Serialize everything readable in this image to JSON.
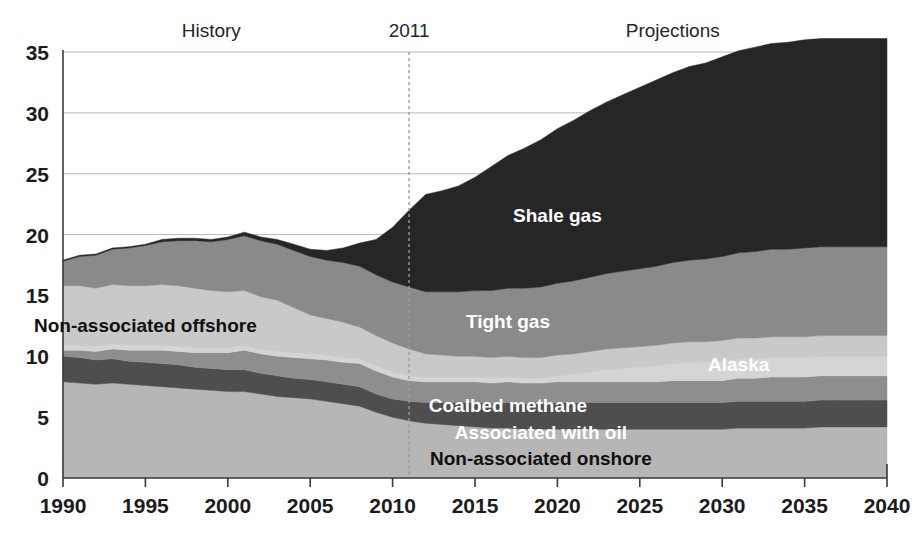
{
  "chart_data": {
    "type": "area",
    "stacked": true,
    "title": "",
    "subtitle": "",
    "xlabel": "",
    "ylabel": "",
    "xlim": [
      1990,
      2040
    ],
    "ylim": [
      0,
      35
    ],
    "ytick_labels": [
      "0",
      "5",
      "10",
      "15",
      "20",
      "25",
      "30",
      "35"
    ],
    "ytick_values": [
      0,
      5,
      10,
      15,
      20,
      25,
      30,
      35
    ],
    "xtick_labels": [
      "1990",
      "1995",
      "2000",
      "2005",
      "2010",
      "2015",
      "2020",
      "2025",
      "2030",
      "2035",
      "2040"
    ],
    "xtick_values": [
      1990,
      1995,
      2000,
      2005,
      2010,
      2015,
      2020,
      2025,
      2030,
      2035,
      2040
    ],
    "grid": true,
    "legend_position": "inline-annotations",
    "annotations": [
      {
        "name": "history-label",
        "text": "History",
        "x": 1999,
        "y": 36.2
      },
      {
        "name": "projection-divider-label",
        "text": "2011",
        "x": 2011,
        "y": 36.2
      },
      {
        "name": "projections-label",
        "text": "Projections",
        "x": 2027,
        "y": 36.2
      }
    ],
    "divider": {
      "x": 2011,
      "style": "dashed"
    },
    "x": [
      1990,
      1991,
      1992,
      1993,
      1994,
      1995,
      1996,
      1997,
      1998,
      1999,
      2000,
      2001,
      2002,
      2003,
      2004,
      2005,
      2006,
      2007,
      2008,
      2009,
      2010,
      2011,
      2012,
      2013,
      2014,
      2015,
      2016,
      2017,
      2018,
      2019,
      2020,
      2021,
      2022,
      2023,
      2024,
      2025,
      2026,
      2027,
      2028,
      2029,
      2030,
      2031,
      2032,
      2033,
      2034,
      2035,
      2036,
      2037,
      2038,
      2039,
      2040
    ],
    "series": [
      {
        "name": "Non-associated onshore",
        "color": "#b6b6b6",
        "label_x": 2019,
        "label_y": 1.1,
        "label_color": "dark",
        "values": [
          7.9,
          7.8,
          7.7,
          7.8,
          7.7,
          7.6,
          7.5,
          7.4,
          7.3,
          7.2,
          7.1,
          7.1,
          6.9,
          6.7,
          6.6,
          6.5,
          6.3,
          6.1,
          5.9,
          5.4,
          5.0,
          4.7,
          4.5,
          4.4,
          4.3,
          4.2,
          4.1,
          4.1,
          4.0,
          4.0,
          4.0,
          4.0,
          4.0,
          4.0,
          4.0,
          4.0,
          4.0,
          4.0,
          4.0,
          4.0,
          4.0,
          4.1,
          4.1,
          4.1,
          4.1,
          4.1,
          4.2,
          4.2,
          4.2,
          4.2,
          4.2
        ]
      },
      {
        "name": "Associated with oil",
        "color": "#4e4e4e",
        "label_x": 2019,
        "label_y": 3.2,
        "label_color": "light",
        "values": [
          2.1,
          2.1,
          2.0,
          2.0,
          1.9,
          1.9,
          1.9,
          1.9,
          1.8,
          1.8,
          1.8,
          1.8,
          1.7,
          1.7,
          1.6,
          1.6,
          1.6,
          1.6,
          1.6,
          1.5,
          1.5,
          1.6,
          1.7,
          1.8,
          1.9,
          2.0,
          2.0,
          2.1,
          2.1,
          2.1,
          2.2,
          2.2,
          2.2,
          2.2,
          2.2,
          2.2,
          2.2,
          2.2,
          2.2,
          2.2,
          2.2,
          2.2,
          2.2,
          2.2,
          2.2,
          2.2,
          2.2,
          2.2,
          2.2,
          2.2,
          2.2
        ]
      },
      {
        "name": "Coalbed methane",
        "color": "#8e8e8e",
        "label_x": 2017,
        "label_y": 5.4,
        "label_color": "light",
        "values": [
          0.5,
          0.6,
          0.7,
          0.8,
          0.9,
          1.0,
          1.1,
          1.1,
          1.2,
          1.3,
          1.4,
          1.6,
          1.6,
          1.6,
          1.7,
          1.7,
          1.8,
          1.8,
          1.9,
          1.9,
          1.8,
          1.7,
          1.7,
          1.7,
          1.7,
          1.7,
          1.7,
          1.7,
          1.7,
          1.7,
          1.7,
          1.7,
          1.7,
          1.7,
          1.7,
          1.7,
          1.7,
          1.8,
          1.8,
          1.8,
          1.8,
          1.9,
          1.9,
          2.0,
          2.0,
          2.0,
          2.0,
          2.0,
          2.0,
          2.0,
          2.0
        ]
      },
      {
        "name": "Alaska",
        "color": "#d5d5d5",
        "label_x": 2031,
        "label_y": 8.8,
        "label_color": "light",
        "values": [
          0.4,
          0.4,
          0.4,
          0.4,
          0.4,
          0.4,
          0.4,
          0.4,
          0.4,
          0.4,
          0.4,
          0.4,
          0.4,
          0.4,
          0.4,
          0.4,
          0.4,
          0.4,
          0.4,
          0.4,
          0.4,
          0.4,
          0.4,
          0.4,
          0.4,
          0.4,
          0.4,
          0.4,
          0.4,
          0.4,
          0.5,
          0.6,
          0.8,
          1.0,
          1.1,
          1.2,
          1.3,
          1.4,
          1.5,
          1.5,
          1.6,
          1.6,
          1.6,
          1.6,
          1.6,
          1.6,
          1.6,
          1.6,
          1.6,
          1.6,
          1.6
        ]
      },
      {
        "name": "Non-associated offshore",
        "color": "#c9c9c9",
        "label_x": 1995,
        "label_y": 12.0,
        "label_color": "dark",
        "values": [
          4.9,
          4.9,
          4.8,
          4.9,
          4.9,
          4.9,
          5.0,
          5.0,
          4.9,
          4.7,
          4.6,
          4.5,
          4.3,
          4.2,
          3.7,
          3.2,
          3.0,
          2.9,
          2.6,
          2.5,
          2.4,
          2.2,
          1.9,
          1.8,
          1.7,
          1.7,
          1.7,
          1.7,
          1.7,
          1.7,
          1.7,
          1.7,
          1.7,
          1.7,
          1.7,
          1.7,
          1.7,
          1.7,
          1.7,
          1.7,
          1.7,
          1.7,
          1.7,
          1.7,
          1.7,
          1.7,
          1.7,
          1.7,
          1.7,
          1.7,
          1.7
        ]
      },
      {
        "name": "Tight gas",
        "color": "#8a8a8a",
        "label_x": 2017,
        "label_y": 12.3,
        "label_color": "light",
        "values": [
          2.0,
          2.4,
          2.7,
          2.9,
          3.1,
          3.3,
          3.5,
          3.7,
          3.9,
          4.0,
          4.3,
          4.5,
          4.6,
          4.6,
          4.7,
          4.8,
          4.8,
          4.9,
          5.0,
          5.0,
          5.0,
          5.1,
          5.1,
          5.2,
          5.3,
          5.4,
          5.5,
          5.6,
          5.7,
          5.8,
          5.9,
          6.0,
          6.1,
          6.2,
          6.3,
          6.4,
          6.5,
          6.6,
          6.7,
          6.8,
          6.9,
          7.0,
          7.1,
          7.2,
          7.2,
          7.3,
          7.3,
          7.3,
          7.3,
          7.3,
          7.3
        ]
      },
      {
        "name": "Shale gas",
        "color": "#262626",
        "label_x": 2020,
        "label_y": 21.0,
        "label_color": "light",
        "values": [
          0.1,
          0.1,
          0.1,
          0.1,
          0.1,
          0.1,
          0.2,
          0.2,
          0.2,
          0.2,
          0.2,
          0.3,
          0.3,
          0.4,
          0.5,
          0.6,
          0.8,
          1.2,
          1.9,
          2.9,
          4.5,
          6.3,
          8.0,
          8.3,
          8.7,
          9.3,
          10.2,
          10.9,
          11.5,
          12.1,
          12.7,
          13.2,
          13.7,
          14.1,
          14.5,
          14.9,
          15.3,
          15.6,
          15.9,
          16.1,
          16.4,
          16.6,
          16.8,
          16.9,
          17.0,
          17.1,
          17.1,
          17.1,
          17.1,
          17.1,
          17.1
        ]
      }
    ]
  },
  "axis": {
    "y_label_color": "#1c1c1c",
    "x_label_color": "#1c1c1c",
    "grid_color": "#b9b9b9",
    "axis_color": "#3a3a3a"
  }
}
